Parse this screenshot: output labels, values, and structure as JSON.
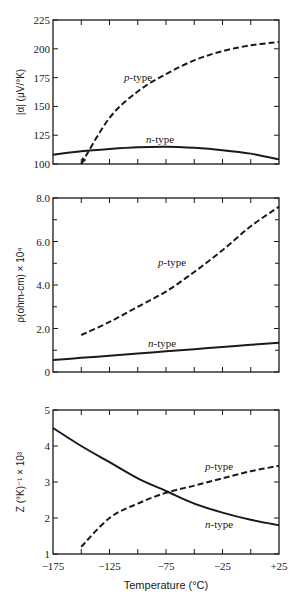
{
  "chart_data": [
    {
      "type": "line",
      "title": "",
      "ylabel": "|α| (μV/°K)",
      "xlabel": "",
      "x": [
        -175,
        -150,
        -125,
        -100,
        -75,
        -50,
        -25,
        0,
        25
      ],
      "ylim": [
        100,
        225
      ],
      "yticks": [
        "100",
        "125",
        "150",
        "175",
        "200",
        "225"
      ],
      "grid": false,
      "series": [
        {
          "name": "p-type",
          "style": "dashed",
          "x": [
            -150,
            -125,
            -100,
            -75,
            -50,
            -25,
            0,
            25
          ],
          "values": [
            100,
            140,
            163,
            178,
            190,
            198,
            203,
            206
          ]
        },
        {
          "name": "n-type",
          "style": "solid",
          "x": [
            -175,
            -150,
            -125,
            -100,
            -75,
            -50,
            -25,
            0,
            25
          ],
          "values": [
            108,
            111,
            113,
            114.5,
            115,
            114,
            112,
            109,
            104
          ]
        }
      ]
    },
    {
      "type": "line",
      "title": "",
      "ylabel": "ρ(ohm-cm) × 10⁴",
      "xlabel": "",
      "x": [
        -175,
        -150,
        -125,
        -100,
        -75,
        -50,
        -25,
        0,
        25
      ],
      "ylim": [
        0,
        8.0
      ],
      "yticks": [
        "0",
        "2.0",
        "4.0",
        "6.0",
        "8.0"
      ],
      "grid": false,
      "series": [
        {
          "name": "p-type",
          "style": "dashed",
          "x": [
            -150,
            -125,
            -100,
            -75,
            -50,
            -25,
            0,
            25
          ],
          "values": [
            1.7,
            2.3,
            3.0,
            3.7,
            4.6,
            5.6,
            6.7,
            7.6
          ]
        },
        {
          "name": "n-type",
          "style": "solid",
          "x": [
            -175,
            -150,
            -125,
            -100,
            -75,
            -50,
            -25,
            0,
            25
          ],
          "values": [
            0.55,
            0.65,
            0.75,
            0.85,
            0.95,
            1.05,
            1.15,
            1.25,
            1.35
          ]
        }
      ]
    },
    {
      "type": "line",
      "title": "",
      "ylabel": "Z (°K)⁻¹ × 10³",
      "xlabel": "Temperature (°C)",
      "x": [
        -175,
        -150,
        -125,
        -100,
        -75,
        -50,
        -25,
        0,
        25
      ],
      "xticks": [
        "−175",
        "−125",
        "−75",
        "−25",
        "+25"
      ],
      "ylim": [
        1,
        5
      ],
      "yticks": [
        "1",
        "2",
        "3",
        "4",
        "5"
      ],
      "grid": false,
      "series": [
        {
          "name": "n-type",
          "style": "solid",
          "x": [
            -175,
            -150,
            -125,
            -100,
            -75,
            -50,
            -25,
            0,
            25
          ],
          "values": [
            4.5,
            4.0,
            3.55,
            3.1,
            2.75,
            2.4,
            2.15,
            1.95,
            1.8
          ]
        },
        {
          "name": "p-type",
          "style": "dashed",
          "x": [
            -150,
            -125,
            -100,
            -75,
            -50,
            -25,
            0,
            25
          ],
          "values": [
            1.2,
            2.0,
            2.4,
            2.7,
            2.9,
            3.1,
            3.3,
            3.45
          ]
        }
      ]
    }
  ],
  "labels": {
    "p1_ylabel": "|α| (μV/°K)",
    "p2_ylabel": "ρ(ohm-cm) × 10⁴",
    "p3_ylabel": "Z (°K)⁻¹ × 10³",
    "xlabel": "Temperature (°C)",
    "p_type": "p",
    "n_type": "n",
    "type_suffix": "-type",
    "p1_yticks": [
      "100",
      "125",
      "150",
      "175",
      "200",
      "225"
    ],
    "p2_yticks": [
      "0",
      "2.0",
      "4.0",
      "6.0",
      "8.0"
    ],
    "p3_yticks": [
      "1",
      "2",
      "3",
      "4",
      "5"
    ],
    "xticks": [
      "−175",
      "−125",
      "−75",
      "−25",
      "+25"
    ]
  }
}
